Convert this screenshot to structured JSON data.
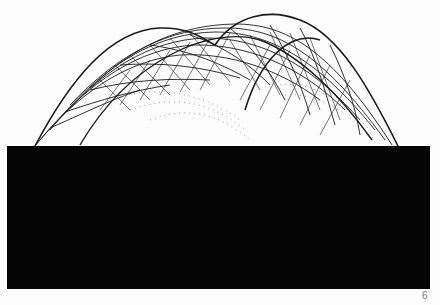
{
  "page": {
    "page_number": "6",
    "figure": {
      "subject": "wireframe-mesh-surface-with-inverted-reflection",
      "upper_half": {
        "background": "#fdfdfd",
        "line_color": "#1a1a1a"
      },
      "lower_half": {
        "background": "#050505",
        "line_color": "#e8e8e8"
      }
    }
  }
}
